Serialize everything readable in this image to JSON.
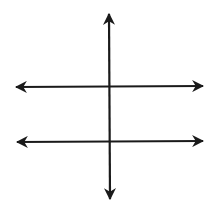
{
  "diagram": {
    "title": "",
    "stroke_color": "#1a1a1a",
    "background": "#ffffff",
    "lines": [
      {
        "id": "transversal",
        "orientation": "vertical",
        "x1": 109,
        "y1": 14,
        "x2": 110,
        "y2": 199,
        "arrows": "both"
      },
      {
        "id": "parallel-line-1",
        "orientation": "horizontal",
        "x1": 16,
        "y1": 87,
        "x2": 203,
        "y2": 86,
        "arrows": "both"
      },
      {
        "id": "parallel-line-2",
        "orientation": "horizontal",
        "x1": 17,
        "y1": 142,
        "x2": 203,
        "y2": 141,
        "arrows": "both"
      }
    ],
    "labels": []
  }
}
